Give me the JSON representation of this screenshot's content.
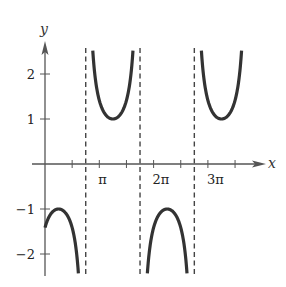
{
  "chart_data": {
    "type": "line",
    "title": "",
    "function": "y = csc(x - 3π/4)",
    "xlabel": "x",
    "ylabel": "y",
    "x_tick_labels": [
      {
        "value_pi": 1,
        "label": "π"
      },
      {
        "value_pi": 2,
        "label": "2π"
      },
      {
        "value_pi": 3,
        "label": "3π"
      }
    ],
    "x_minor_ticks_pi": [
      0.5,
      1,
      1.5,
      2,
      2.5,
      3,
      3.5
    ],
    "y_tick_labels": [
      {
        "value": 2,
        "label": "2"
      },
      {
        "value": 1,
        "label": "1"
      },
      {
        "value": -1,
        "label": "−1"
      },
      {
        "value": -2,
        "label": "−2"
      }
    ],
    "asymptotes_pi": [
      0.75,
      1.75,
      2.75
    ],
    "branches": [
      {
        "from_pi": 0.0,
        "to_pi": 0.75,
        "sign": -1,
        "extremum": {
          "x_pi": 0.25,
          "y": -1
        }
      },
      {
        "from_pi": 0.75,
        "to_pi": 1.75,
        "sign": 1,
        "extremum": {
          "x_pi": 1.25,
          "y": 1
        }
      },
      {
        "from_pi": 1.75,
        "to_pi": 2.75,
        "sign": -1,
        "extremum": {
          "x_pi": 2.25,
          "y": -1
        }
      },
      {
        "from_pi": 2.75,
        "to_pi": 3.75,
        "sign": 1,
        "extremum": {
          "x_pi": 3.25,
          "y": 1
        }
      }
    ],
    "xlim_pi": [
      -0.15,
      4.0
    ],
    "ylim": [
      -2.5,
      2.7
    ],
    "grid": false,
    "legend": null
  },
  "layout": {
    "origin_px": [
      45,
      164
    ],
    "px_per_pi": 54.3,
    "px_per_unit_y": 45,
    "curve_color": "#333333",
    "axis_color": "#555555",
    "dash_color": "#444444"
  }
}
